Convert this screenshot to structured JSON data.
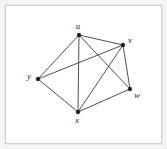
{
  "figure": {
    "kind": "undirected-graph-diagram",
    "background_color": "#ffffff",
    "frame_color": "#cfcfcf",
    "edge_color": "#3a3a46",
    "vertex_color": "#1a1a22",
    "label_color": "#2a2a33"
  },
  "chart_data": {
    "type": "scatter",
    "title": "",
    "xlabel": "",
    "ylabel": "",
    "grid": false,
    "legend": "none",
    "xlim": [
      0,
      167
    ],
    "ylim": [
      0,
      149
    ],
    "nodes": [
      {
        "id": "u",
        "label": "u",
        "x": 79,
        "y": 35,
        "label_x": 78,
        "label_y": 27,
        "degree": 4
      },
      {
        "id": "v",
        "label": "v",
        "x": 123,
        "y": 45,
        "label_x": 130,
        "label_y": 41,
        "degree": 4
      },
      {
        "id": "y",
        "label": "y",
        "x": 38,
        "y": 79,
        "label_x": 29,
        "label_y": 77,
        "degree": 3
      },
      {
        "id": "w",
        "label": "w",
        "x": 130,
        "y": 89,
        "label_x": 137,
        "label_y": 96,
        "degree": 3
      },
      {
        "id": "x",
        "label": "x",
        "x": 78,
        "y": 112,
        "label_x": 77,
        "label_y": 121,
        "degree": 4
      }
    ],
    "edges": [
      {
        "source": "u",
        "target": "v"
      },
      {
        "source": "u",
        "target": "y"
      },
      {
        "source": "u",
        "target": "x"
      },
      {
        "source": "u",
        "target": "w"
      },
      {
        "source": "v",
        "target": "y"
      },
      {
        "source": "v",
        "target": "x"
      },
      {
        "source": "v",
        "target": "w"
      },
      {
        "source": "y",
        "target": "x"
      },
      {
        "source": "x",
        "target": "w"
      }
    ],
    "node_count": 5,
    "edge_count": 9,
    "missing_edges": [
      {
        "source": "y",
        "target": "w"
      }
    ]
  }
}
